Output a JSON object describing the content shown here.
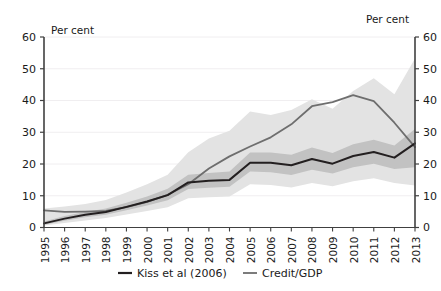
{
  "chart_data": {
    "type": "line",
    "title": "",
    "subtitle": "",
    "xlabel": "",
    "ylabel": "Per cent",
    "ylabel_right": "Per cent",
    "ylim": [
      0,
      60
    ],
    "yticks": [
      0,
      10,
      20,
      30,
      40,
      50,
      60
    ],
    "yticks_right": [
      0,
      10,
      20,
      30,
      40,
      50,
      60
    ],
    "grid": true,
    "legend_position": "bottom",
    "categories": [
      "1995",
      "1996",
      "1997",
      "1998",
      "1999",
      "2000",
      "2001",
      "2002",
      "2003",
      "2004",
      "2005",
      "2006",
      "2007",
      "2008",
      "2009",
      "2010",
      "2011",
      "2012",
      "2013"
    ],
    "x": [
      1995,
      1996,
      1997,
      1998,
      1999,
      2000,
      2001,
      2002,
      2003,
      2004,
      2005,
      2006,
      2007,
      2008,
      2009,
      2010,
      2011,
      2012,
      2013
    ],
    "series": [
      {
        "name": "Kiss et al (2006)",
        "color": "#231f20",
        "width": 2.0,
        "values": [
          1.3,
          2.8,
          4.0,
          4.9,
          6.5,
          8.2,
          10.2,
          14.2,
          14.7,
          15.0,
          20.4,
          20.4,
          19.6,
          21.6,
          20.1,
          22.5,
          23.8,
          22.0,
          26.5
        ]
      },
      {
        "name": "Credit/GDP",
        "color": "#6e6e6e",
        "width": 1.8,
        "values": [
          5.4,
          4.9,
          5.0,
          5.2,
          6.4,
          8.1,
          10.3,
          13.6,
          18.6,
          22.4,
          25.5,
          28.4,
          32.5,
          38.2,
          39.5,
          41.7,
          39.8,
          33.0,
          25.3
        ]
      }
    ],
    "bands": [
      {
        "name": "outer-confidence-band",
        "series": "Kiss et al (2006)",
        "color": "#e3e3e3",
        "lower": [
          0.6,
          1.4,
          2.2,
          3.0,
          4.1,
          5.2,
          6.4,
          9.2,
          9.5,
          9.8,
          13.6,
          13.4,
          12.6,
          14.0,
          13.0,
          14.6,
          15.5,
          14.0,
          13.2
        ],
        "upper": [
          6.0,
          6.6,
          7.4,
          8.7,
          11.0,
          13.6,
          16.6,
          23.7,
          28.0,
          30.5,
          36.5,
          35.4,
          37.0,
          40.4,
          37.4,
          43.0,
          47.0,
          42.0,
          53.2
        ]
      },
      {
        "name": "inner-confidence-band",
        "series": "Kiss et al (2006)",
        "color": "#c2c2c2",
        "lower": [
          0.9,
          2.1,
          3.2,
          4.0,
          5.4,
          6.9,
          8.6,
          12.1,
          12.5,
          12.8,
          17.6,
          17.4,
          16.5,
          18.2,
          17.0,
          19.0,
          20.1,
          18.4,
          19.0
        ],
        "upper": [
          1.9,
          3.6,
          4.9,
          6.0,
          7.8,
          9.8,
          12.2,
          16.6,
          17.2,
          17.6,
          23.6,
          23.6,
          22.9,
          25.2,
          23.5,
          26.2,
          27.6,
          25.8,
          31.0
        ]
      }
    ]
  },
  "legend": {
    "items": [
      {
        "label": "Kiss et al (2006)",
        "color": "#231f20"
      },
      {
        "label": "Credit/GDP",
        "color": "#6e6e6e"
      }
    ]
  },
  "axes": {
    "left_unit": "Per cent",
    "right_unit": "Per cent"
  }
}
